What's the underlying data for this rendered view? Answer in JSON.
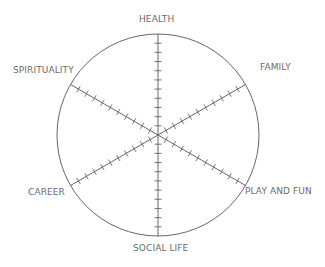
{
  "diagram": {
    "type": "wheel-of-life",
    "center": [
      158,
      135
    ],
    "radius": 101,
    "ticks_per_spoke": 10,
    "line_color": "#555555",
    "label_color": "#6b6b6b",
    "categories": [
      {
        "label": "HEALTH",
        "angle": -90
      },
      {
        "label": "FAMILY",
        "angle": -30
      },
      {
        "label": "PLAY AND FUN",
        "angle": 30
      },
      {
        "label": "SOCIAL LIFE",
        "angle": 90
      },
      {
        "label": "CAREER",
        "angle": 150
      },
      {
        "label": "SPIRITUALITY",
        "angle": 210
      }
    ]
  }
}
